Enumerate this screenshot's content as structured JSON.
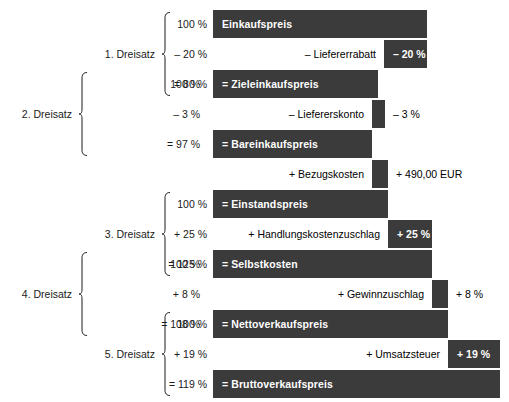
{
  "diagram": {
    "colors": {
      "bar": "#3b3b3b",
      "bar_text": "#ffffff",
      "page_bg": "#ffffff",
      "text": "#1a1a1a"
    },
    "rows": [
      {
        "id": "einkaufspreis",
        "kind": "bar",
        "label": "Einkaufspreis",
        "percent": "100 %",
        "value": "",
        "bar_left": 213,
        "bar_right": 427,
        "y": 10,
        "h": 28
      },
      {
        "id": "liefererrabatt",
        "kind": "op",
        "label": "– Liefererrabatt",
        "percent": "– 20 %",
        "value": "– 20 %",
        "bar_left": 213,
        "bar_right": 427,
        "chip_left": 384,
        "y": 40,
        "h": 28
      },
      {
        "id": "zieleinkaufspreis",
        "kind": "bar",
        "label": "= Zieleinkaufspreis",
        "percent": "= 80 %",
        "value": "",
        "bar_left": 213,
        "bar_right": 378,
        "y": 70,
        "h": 28
      },
      {
        "id": "liefererskonto",
        "kind": "op",
        "label": "– Liefererskonto",
        "percent": "– 3 %",
        "value": "– 3 %",
        "bar_left": 213,
        "bar_right": 385,
        "chip_left": 372,
        "y": 100,
        "h": 28
      },
      {
        "id": "bareinkaufspreis",
        "kind": "bar",
        "label": "= Bareinkaufspreis",
        "percent": "= 97 %",
        "value": "",
        "bar_left": 213,
        "bar_right": 372,
        "y": 130,
        "h": 28
      },
      {
        "id": "bezugskosten",
        "kind": "op",
        "label": "+ Bezugskosten",
        "percent": "",
        "value": "+ 490,00 EUR",
        "bar_left": 213,
        "bar_right": 388,
        "chip_left": 372,
        "y": 160,
        "h": 28
      },
      {
        "id": "einstandspreis",
        "kind": "bar",
        "label": "= Einstandspreis",
        "percent": "100 %",
        "value": "",
        "bar_left": 213,
        "bar_right": 388,
        "y": 190,
        "h": 28
      },
      {
        "id": "handlungskostenzuschlag",
        "kind": "op",
        "label": "+ Handlungskostenzuschlag",
        "percent": "+ 25 %",
        "value": "+ 25 %",
        "bar_left": 213,
        "bar_right": 432,
        "chip_left": 388,
        "y": 220,
        "h": 28
      },
      {
        "id": "selbstkosten",
        "kind": "bar",
        "label": "= Selbstkosten",
        "percent": "= 125 %",
        "value": "",
        "bar_left": 213,
        "bar_right": 432,
        "y": 250,
        "h": 28
      },
      {
        "id": "gewinnzuschlag",
        "kind": "op",
        "label": "+ Gewinnzuschlag",
        "percent": "+ 8 %",
        "value": "+ 8 %",
        "bar_left": 213,
        "bar_right": 448,
        "chip_left": 432,
        "y": 280,
        "h": 28
      },
      {
        "id": "nettoverkaufspreis",
        "kind": "bar",
        "label": "= Nettoverkaufspreis",
        "percent": "100 %",
        "value": "",
        "bar_left": 213,
        "bar_right": 448,
        "y": 310,
        "h": 28
      },
      {
        "id": "umsatzsteuer",
        "kind": "op",
        "label": "+ Umsatzsteuer",
        "percent": "+ 19 %",
        "value": "+ 19 %",
        "bar_left": 213,
        "bar_right": 500,
        "chip_left": 448,
        "y": 340,
        "h": 28
      },
      {
        "id": "bruttoverkaufspreis",
        "kind": "bar",
        "label": "= Bruttoverkaufspreis",
        "percent": "= 119 %",
        "value": "",
        "bar_left": 213,
        "bar_right": 500,
        "y": 370,
        "h": 28
      }
    ],
    "left_percents": [
      {
        "id": "p-2d-100",
        "text": "100 %",
        "y": 84,
        "right": 200
      },
      {
        "id": "p-2d-3",
        "text": "– 3 %",
        "y": 114,
        "right": 200
      },
      {
        "id": "p-2d-97",
        "text": "= 97 %",
        "y": 144,
        "right": 200
      },
      {
        "id": "p-4d-100",
        "text": "100 %",
        "y": 264,
        "right": 200
      },
      {
        "id": "p-4d-8",
        "text": "+ 8 %",
        "y": 294,
        "right": 200
      },
      {
        "id": "p-4d-108",
        "text": "= 108 %",
        "y": 324,
        "right": 200
      }
    ],
    "inner_percents": [
      {
        "id": "q-1d-100",
        "text": "100 %",
        "y": 24,
        "right": 207
      },
      {
        "id": "q-1d-20",
        "text": "– 20 %",
        "y": 54,
        "right": 207
      },
      {
        "id": "q-1d-80",
        "text": "= 80 %",
        "y": 84,
        "right": 207
      },
      {
        "id": "q-3d-100",
        "text": "100 %",
        "y": 204,
        "right": 207
      },
      {
        "id": "q-3d-25",
        "text": "+ 25 %",
        "y": 234,
        "right": 207
      },
      {
        "id": "q-3d-125",
        "text": "= 125 %",
        "y": 264,
        "right": 207
      },
      {
        "id": "q-5d-100",
        "text": "100 %",
        "y": 324,
        "right": 207
      },
      {
        "id": "q-5d-19",
        "text": "+ 19 %",
        "y": 354,
        "right": 207
      },
      {
        "id": "q-5d-119",
        "text": "= 119 %",
        "y": 384,
        "right": 207
      }
    ],
    "dreisatz_labels": [
      {
        "id": "dreisatz-1",
        "text": "1. Dreisatz",
        "y": 54,
        "right": 155
      },
      {
        "id": "dreisatz-2",
        "text": "2. Dreisatz",
        "y": 114,
        "right": 72
      },
      {
        "id": "dreisatz-3",
        "text": "3. Dreisatz",
        "y": 234,
        "right": 155
      },
      {
        "id": "dreisatz-4",
        "text": "4. Dreisatz",
        "y": 294,
        "right": 72
      },
      {
        "id": "dreisatz-5",
        "text": "5. Dreisatz",
        "y": 354,
        "right": 155
      }
    ],
    "braces": [
      {
        "id": "brace-1",
        "x": 161,
        "top": 12,
        "bottom": 96,
        "w": 9
      },
      {
        "id": "brace-2",
        "x": 78,
        "top": 72,
        "bottom": 156,
        "w": 9
      },
      {
        "id": "brace-3",
        "x": 161,
        "top": 192,
        "bottom": 276,
        "w": 9
      },
      {
        "id": "brace-4",
        "x": 78,
        "top": 252,
        "bottom": 336,
        "w": 9
      },
      {
        "id": "brace-5",
        "x": 161,
        "top": 312,
        "bottom": 396,
        "w": 9
      }
    ]
  }
}
